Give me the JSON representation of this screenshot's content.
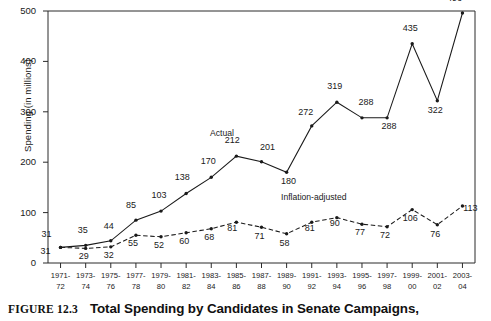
{
  "figure": {
    "tag": "FIGURE 12.3",
    "caption": "Total Spending by Candidates in Senate Campaigns,"
  },
  "chart_data": {
    "type": "line",
    "title": "Total Spending by Candidates in Senate Campaigns,",
    "xlabel": "",
    "ylabel": "Spending (in millions)",
    "ylim": [
      0,
      500
    ],
    "yticks": [
      0,
      100,
      200,
      300,
      400,
      500
    ],
    "grid": false,
    "legend_position": "inline-annotation",
    "categories": [
      "1971-72",
      "1973-74",
      "1975-76",
      "1977-78",
      "1979-80",
      "1981-82",
      "1983-84",
      "1985-86",
      "1987-88",
      "1989-90",
      "1991-92",
      "1993-94",
      "1995-96",
      "1997-98",
      "1999-00",
      "2001-02",
      "2003-04"
    ],
    "category_lines": [
      {
        "l1": "1971-",
        "l2": "72"
      },
      {
        "l1": "1973-",
        "l2": "74"
      },
      {
        "l1": "1975-",
        "l2": "76"
      },
      {
        "l1": "1977-",
        "l2": "78"
      },
      {
        "l1": "1979-",
        "l2": "80"
      },
      {
        "l1": "1981-",
        "l2": "82"
      },
      {
        "l1": "1983-",
        "l2": "84"
      },
      {
        "l1": "1985-",
        "l2": "86"
      },
      {
        "l1": "1987-",
        "l2": "88"
      },
      {
        "l1": "1989-",
        "l2": "90"
      },
      {
        "l1": "1991-",
        "l2": "92"
      },
      {
        "l1": "1993-",
        "l2": "94"
      },
      {
        "l1": "1995-",
        "l2": "96"
      },
      {
        "l1": "1997-",
        "l2": "98"
      },
      {
        "l1": "1999-",
        "l2": "00"
      },
      {
        "l1": "2001-",
        "l2": "02"
      },
      {
        "l1": "2003-",
        "l2": "04"
      }
    ],
    "series": [
      {
        "name": "Actual",
        "style": "solid",
        "color": "#1a1a1a",
        "values": [
          31,
          35,
          44,
          85,
          103,
          138,
          170,
          212,
          201,
          180,
          272,
          319,
          288,
          288,
          435,
          322,
          496
        ]
      },
      {
        "name": "Inflation-adjusted",
        "style": "dashed",
        "color": "#1a1a1a",
        "values": [
          31,
          29,
          32,
          55,
          52,
          60,
          68,
          81,
          71,
          58,
          81,
          90,
          77,
          72,
          106,
          76,
          113
        ]
      }
    ],
    "annotations": [
      {
        "text": "Actual",
        "series": "Actual"
      },
      {
        "text": "Inflation-adjusted",
        "series": "Inflation-adjusted"
      }
    ]
  }
}
